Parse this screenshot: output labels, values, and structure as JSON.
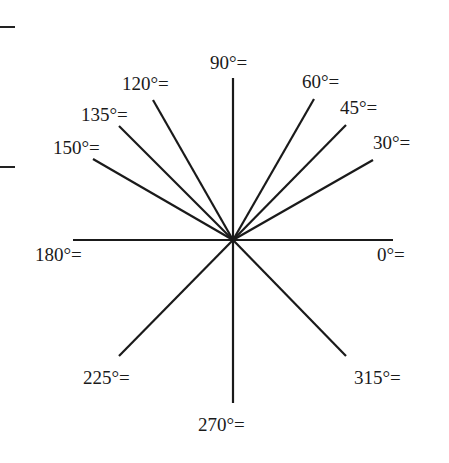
{
  "diagram": {
    "center": [
      233,
      240
    ],
    "rays": [
      {
        "angle": 0,
        "label": "0°=",
        "end": [
          393,
          240
        ],
        "lx": 377,
        "ly": 245
      },
      {
        "angle": 30,
        "label": "30°=",
        "end": [
          373,
          160
        ],
        "lx": 373,
        "ly": 133
      },
      {
        "angle": 45,
        "label": "45°=",
        "end": [
          346,
          125
        ],
        "lx": 340,
        "ly": 98
      },
      {
        "angle": 60,
        "label": "60°=",
        "end": [
          314,
          99
        ],
        "lx": 302,
        "ly": 72
      },
      {
        "angle": 90,
        "label": "90°=",
        "end": [
          233,
          78
        ],
        "lx": 210,
        "ly": 53
      },
      {
        "angle": 120,
        "label": "120°=",
        "end": [
          153,
          100
        ],
        "lx": 122,
        "ly": 74
      },
      {
        "angle": 135,
        "label": "135°=",
        "end": [
          119,
          126
        ],
        "lx": 81,
        "ly": 105
      },
      {
        "angle": 150,
        "label": "150°=",
        "end": [
          93,
          159
        ],
        "lx": 53,
        "ly": 138
      },
      {
        "angle": 180,
        "label": "180°=",
        "end": [
          73,
          240
        ],
        "lx": 35,
        "ly": 245
      },
      {
        "angle": 225,
        "label": "225°=",
        "end": [
          119,
          356
        ],
        "lx": 83,
        "ly": 368
      },
      {
        "angle": 270,
        "label": "270°=",
        "end": [
          233,
          403
        ],
        "lx": 198,
        "ly": 415
      },
      {
        "angle": 315,
        "label": "315°=",
        "end": [
          346,
          356
        ],
        "lx": 354,
        "ly": 368
      }
    ],
    "margin_marks": [
      26,
      166
    ],
    "line_color": "#1a1a1a"
  }
}
